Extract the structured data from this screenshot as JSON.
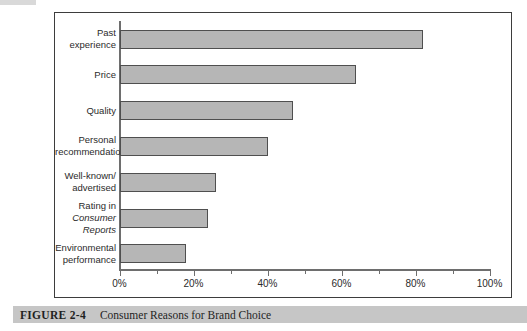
{
  "chart_data": {
    "type": "bar",
    "orientation": "horizontal",
    "title": "Consumer Reasons for Brand Choice",
    "categories": [
      {
        "lines": [
          "Past experience"
        ],
        "italic_line": -1
      },
      {
        "lines": [
          "Price"
        ],
        "italic_line": -1
      },
      {
        "lines": [
          "Quality"
        ],
        "italic_line": -1
      },
      {
        "lines": [
          "Personal",
          "recommendations"
        ],
        "italic_line": -1
      },
      {
        "lines": [
          "Well-known/",
          "advertised"
        ],
        "italic_line": -1
      },
      {
        "lines": [
          "Rating in",
          "Consumer Reports"
        ],
        "italic_line": 1
      },
      {
        "lines": [
          "Environmental",
          "performance"
        ],
        "italic_line": -1
      }
    ],
    "values": [
      82,
      64,
      47,
      40,
      26,
      24,
      18
    ],
    "unit": "%",
    "xlim": [
      0,
      100
    ],
    "x_major_ticks": [
      0,
      20,
      40,
      60,
      80,
      100
    ],
    "x_tick_labels": [
      "0%",
      "20%",
      "40%",
      "60%",
      "80%",
      "100%"
    ],
    "x_minor_ticks": [
      10,
      30,
      50,
      70,
      90
    ],
    "grid": false,
    "legend": false,
    "bar_fill": "#b6b6b6",
    "bar_border": "#4f4f4f"
  },
  "caption": {
    "figure_label": "FIGURE 2-4",
    "title": "Consumer Reasons for Brand Choice"
  }
}
